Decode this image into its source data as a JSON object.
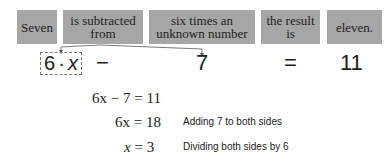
{
  "phrase_boxes": [
    {
      "text": "Seven"
    },
    {
      "line1": "is subtracted",
      "line2": "from"
    },
    {
      "line1": "six times an",
      "line2": "unknown number"
    },
    {
      "line1": "the result",
      "line2": "is"
    },
    {
      "text": "eleven."
    }
  ],
  "translation": {
    "term1_coef": "6",
    "term1_dot": "·",
    "term1_var": "x",
    "minus": "−",
    "seven": "7",
    "equals": "=",
    "result": "11"
  },
  "solution_steps": [
    {
      "left": "6x − 7",
      "right": "11",
      "note": ""
    },
    {
      "left": "6x",
      "right": "18",
      "note": "Adding 7 to both sides"
    },
    {
      "left": "x",
      "right": "3",
      "note": "Dividing both sides by 6"
    }
  ],
  "colors": {
    "box_fill": "#a6a6a6",
    "text": "#222222",
    "arrow": "#555555"
  }
}
